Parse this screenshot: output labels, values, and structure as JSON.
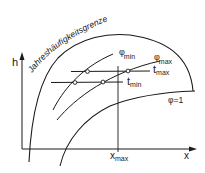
{
  "diagram": {
    "type": "Mollier h-x diagram",
    "axes": {
      "y_label": "h",
      "x_label": "x",
      "x_marker_label": "x",
      "x_marker_sub": "max"
    },
    "curves": {
      "boundary_label": "Jahreshäufigkeitsgrenze",
      "saturation_label": "φ=1",
      "phi_min_label": "φ",
      "phi_min_sub": "min",
      "phi_max_label": "φ",
      "phi_max_sub": "max",
      "t_max_label": "t",
      "t_max_sub": "max",
      "t_min_label": "t",
      "t_min_sub": "min"
    },
    "colors": {
      "line": "#1a1a1a",
      "background": "#ffffff"
    }
  }
}
